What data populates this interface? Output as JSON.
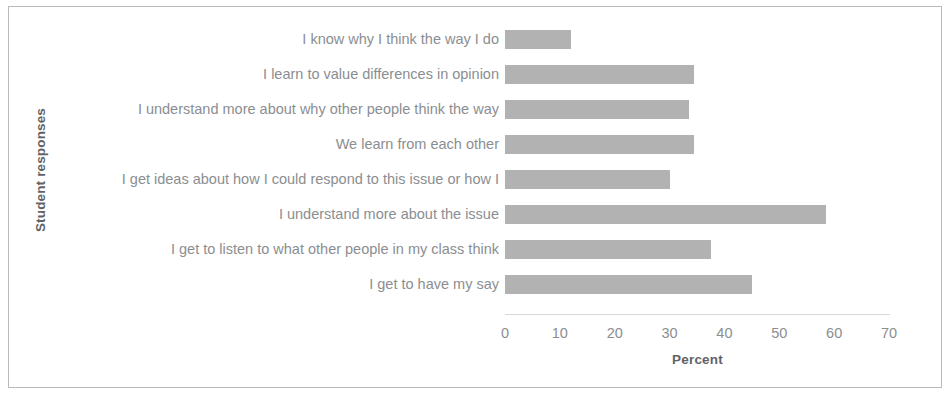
{
  "chart_data": {
    "type": "bar",
    "orientation": "horizontal",
    "title": "",
    "xlabel": "Percent",
    "ylabel": "Student responses",
    "xlim": [
      0,
      70
    ],
    "xticks": [
      0,
      10,
      20,
      30,
      40,
      50,
      60,
      70
    ],
    "grid": false,
    "legend": false,
    "bar_color": "#b2b2b2",
    "categories": [
      "I know why I think the way I do",
      "I learn to value differences in opinion",
      "I understand more about why other people think the way",
      "We learn from each other",
      "I get ideas about how I could respond to this issue or how I",
      "I understand more about the issue",
      "I get to listen to what other people in my class think",
      "I get to have my say"
    ],
    "values": [
      12,
      34.5,
      33.5,
      34.5,
      30,
      58.5,
      37.5,
      45
    ]
  },
  "figure": {
    "border_color": "#b9bbbd",
    "background": "#ffffff"
  }
}
